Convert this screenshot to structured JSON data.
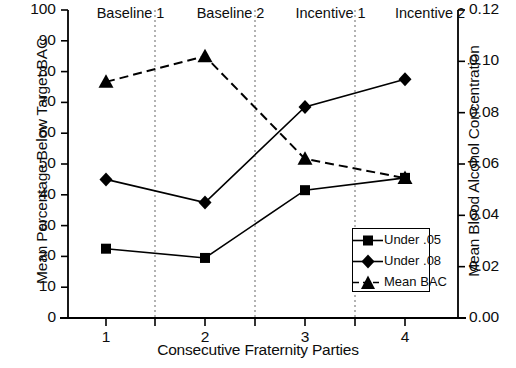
{
  "chart_data": {
    "type": "line",
    "title": "",
    "xlabel": "Consecutive Fraternity Parties",
    "ylabel": "Mean Percentage Below Target BAC",
    "y2label": "Mean Blood Alcohol Concentration",
    "x": [
      1,
      2,
      3,
      4
    ],
    "categories": [
      "1",
      "2",
      "3",
      "4"
    ],
    "xticklabels": [
      "1",
      "2",
      "3",
      "4"
    ],
    "yticklabels": [
      "0",
      "10",
      "20",
      "30",
      "40",
      "50",
      "60",
      "70",
      "80",
      "90",
      "100"
    ],
    "ytickvalues": [
      0,
      10,
      20,
      30,
      40,
      50,
      60,
      70,
      80,
      90,
      100
    ],
    "y2ticklabels": [
      "0.00",
      "0.02",
      "0.04",
      "0.06",
      "0.08",
      "0.10",
      "0.12"
    ],
    "y2tickvalues": [
      0.0,
      0.02,
      0.04,
      0.06,
      0.08,
      0.1,
      0.12
    ],
    "ylim": [
      0,
      100
    ],
    "y2lim": [
      0.0,
      0.12
    ],
    "xlim": [
      0.5,
      4.5
    ],
    "grid": false,
    "legend_position": "lower right",
    "series": [
      {
        "name": "Under .05",
        "marker": "square",
        "linestyle": "solid",
        "axis": "left",
        "values": [
          22.5,
          19.5,
          41.5,
          45.5
        ]
      },
      {
        "name": "Under .08",
        "marker": "diamond",
        "linestyle": "solid",
        "axis": "left",
        "values": [
          45.0,
          37.5,
          68.5,
          77.5
        ]
      },
      {
        "name": "Mean BAC",
        "marker": "triangle",
        "linestyle": "dashed",
        "axis": "right",
        "values": [
          0.092,
          0.102,
          0.062,
          0.0545
        ],
        "values_on_left_scale": [
          76.5,
          85.0,
          51.5,
          45.5
        ]
      }
    ],
    "phases": [
      {
        "label": "Baseline 1",
        "x_center": 130.5
      },
      {
        "label": "Baseline 2",
        "x_center": 230.5
      },
      {
        "label": "Incentive 1",
        "x_center": 330.5
      },
      {
        "label": "Incentive 2",
        "x_center": 430.0
      }
    ],
    "phase_dividers": [
      155,
      255,
      355
    ],
    "annotations": []
  },
  "colors": {
    "line": "#000000",
    "marker": "#000000",
    "axis": "#000000",
    "divider": "#808080",
    "background": "#ffffff"
  }
}
